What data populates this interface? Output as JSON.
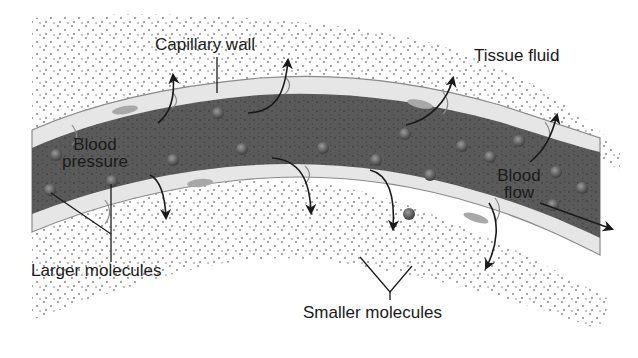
{
  "diagram": {
    "labels": {
      "capillary_wall": "Capillary wall",
      "tissue_fluid": "Tissue fluid",
      "blood_pressure_line1": "Blood",
      "blood_pressure_line2": "pressure",
      "blood_flow_line1": "Blood",
      "blood_flow_line2": "flow",
      "larger_molecules": "Larger molecules",
      "smaller_molecules": "Smaller molecules"
    },
    "colors": {
      "background": "#ffffff",
      "blood": "#5a5a5a",
      "wall": "#e6e6e6",
      "wall_outline": "#8a8a8a",
      "nucleus": "#a8a8a8",
      "molecule_large": "#6e6e6e",
      "dots": "#7a7a7a",
      "arrow": "#1a1a1a",
      "text": "#1a1a1a"
    },
    "arrows": {
      "outward_top_count": 4,
      "outward_bottom_count": 4,
      "flow_direction": "right"
    }
  }
}
